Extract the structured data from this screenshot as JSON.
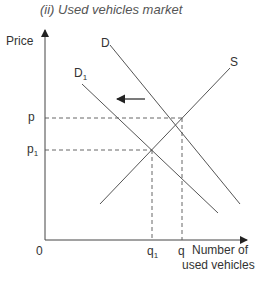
{
  "title": "(ii) Used vehicles market",
  "axes": {
    "y_label": "Price",
    "x_label_line1": "Number of",
    "x_label_line2": "used vehicles",
    "origin": "0"
  },
  "curves": {
    "demand": "D",
    "demand_new": "D",
    "demand_new_sub": "1",
    "supply": "S"
  },
  "markers": {
    "p": "p",
    "p1": "p",
    "p1_sub": "1",
    "q": "q",
    "q1": "q",
    "q1_sub": "1"
  },
  "annotation": {
    "arrow_direction": "left",
    "meaning": "demand shifts left from D to D1"
  },
  "colors": {
    "line": "#555555",
    "axis": "#444444",
    "dashed": "#555555"
  }
}
